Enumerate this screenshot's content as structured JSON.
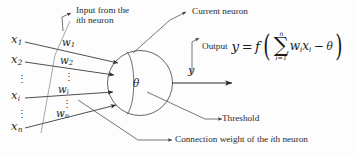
{
  "figure": {
    "background_color": "#fdfdfd",
    "line_color": "#3a3a3a"
  },
  "inputs": {
    "label_x1": "x",
    "sub_x1": "1",
    "label_x2": "x",
    "sub_x2": "2",
    "label_xi": "x",
    "sub_xi": "i",
    "label_xn": "x",
    "sub_xn": "n",
    "vdots_1": "⋮",
    "vdots_2": "⋮"
  },
  "weights": {
    "label_w1": "w",
    "sub_w1": "1",
    "label_w2": "w",
    "sub_w2": "2",
    "label_wi": "w",
    "sub_wi": "i",
    "label_wn": "w",
    "sub_wn": "n",
    "vdots_1": "⋮",
    "vdots_2": "⋮"
  },
  "neuron": {
    "threshold_symbol": "θ",
    "output_symbol": "y"
  },
  "annotations": {
    "input_note_line1": "Input from the",
    "input_note_line2_italic": "i",
    "input_note_line2_rest": "th neuron",
    "current_neuron": "Current neuron",
    "output_word": "Output",
    "threshold": "Threshold",
    "connection_weight_pre": "Connection weight of the ",
    "connection_weight_italic": "i",
    "connection_weight_post": "th neuron"
  },
  "formula": {
    "y": "y",
    "equals": "=",
    "f": "f",
    "paren_open": "(",
    "sigma": "∑",
    "sum_upper": "n",
    "sum_lower": "i=1",
    "w_term": "w",
    "w_sub": "i",
    "x_term": "x",
    "x_sub": "i",
    "minus": "−",
    "theta": "θ",
    "paren_close": ")"
  }
}
